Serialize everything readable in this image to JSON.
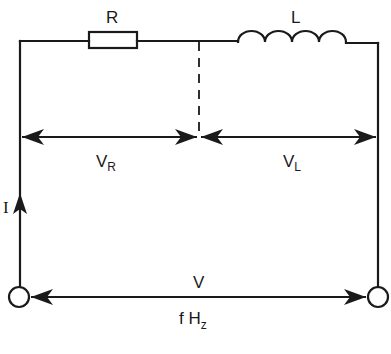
{
  "diagram": {
    "components": {
      "resistor": {
        "label": "R"
      },
      "inductor": {
        "label": "L"
      }
    },
    "voltages": {
      "resistor_voltage": {
        "main": "V",
        "sub": "R"
      },
      "inductor_voltage": {
        "main": "V",
        "sub": "L"
      },
      "supply_voltage": {
        "label": "V"
      }
    },
    "current": {
      "label": "I"
    },
    "frequency": {
      "main": "f H",
      "sub": "z"
    },
    "colors": {
      "ink": "#1a1a1a",
      "background": "#ffffff"
    }
  }
}
